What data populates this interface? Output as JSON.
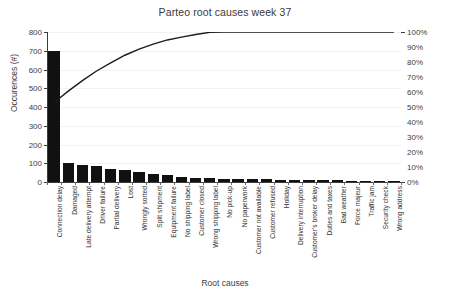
{
  "chart_data": {
    "type": "bar",
    "title": "Parteo root causes week 37",
    "xlabel": "Root causes",
    "ylabel": "Occurences (#)",
    "ylabel_secondary": "",
    "grid": true,
    "legend": "none",
    "ylim": [
      0,
      800
    ],
    "ylim_secondary": [
      0,
      100
    ],
    "ytick_labels": [
      "0",
      "100",
      "200",
      "300",
      "400",
      "500",
      "600",
      "700",
      "800"
    ],
    "ytick_values": [
      0,
      100,
      200,
      300,
      400,
      500,
      600,
      700,
      800
    ],
    "ytick_labels_secondary": [
      "0%",
      "10%",
      "20%",
      "30%",
      "40%",
      "50%",
      "60%",
      "70%",
      "80%",
      "90%",
      "100%"
    ],
    "ytick_values_secondary": [
      0,
      10,
      20,
      30,
      40,
      50,
      60,
      70,
      80,
      90,
      100
    ],
    "categories": [
      "Connection delay",
      "Damaged",
      "Late delivery attempt",
      "Driver failure",
      "Partial delivery",
      "Lost",
      "Wrongly sorted",
      "Split shipment",
      "Equipment failure",
      "No shipping label",
      "Customer closed",
      "Wrong shipping label",
      "No pick-up",
      "No paperwork",
      "Customer not available",
      "Customer refused",
      "Holiday",
      "Delivery interruption",
      "Customer's broker delay",
      "Duties and taxes",
      "Bad weather",
      "Force majeur",
      "Traffic jam",
      "Security check",
      "Wrong address"
    ],
    "values": [
      700,
      100,
      92,
      84,
      72,
      66,
      54,
      44,
      36,
      26,
      22,
      20,
      18,
      16,
      15,
      14,
      13,
      12,
      11,
      10,
      9,
      8,
      7,
      6,
      5
    ],
    "series": [
      {
        "name": "Occurences (#)",
        "type": "bar",
        "axis": "left",
        "values": [
          700,
          100,
          92,
          84,
          72,
          66,
          54,
          44,
          36,
          26,
          22,
          20,
          18,
          16,
          15,
          14,
          13,
          12,
          11,
          10,
          9,
          8,
          7,
          6,
          5
        ]
      },
      {
        "name": "Cumulative %",
        "type": "line",
        "axis": "right",
        "values": [
          53.0,
          60.6,
          67.6,
          74.0,
          79.4,
          84.5,
          88.6,
          91.9,
          94.7,
          96.6,
          98.3,
          99.8,
          101.2,
          102.4,
          103.5,
          104.6,
          105.6,
          106.5,
          107.3,
          108.1,
          108.8,
          109.4,
          109.9,
          110.4,
          110.8
        ]
      }
    ],
    "cumulative_percent": [
      53.0,
      60.6,
      67.6,
      74.0,
      79.4,
      84.5,
      88.6,
      91.9,
      94.7,
      96.6,
      98.3,
      99.8,
      101.2,
      102.4,
      103.5,
      104.6,
      105.6,
      106.5,
      107.3,
      108.1,
      108.8,
      109.4,
      109.9,
      110.4,
      110.8
    ],
    "colors": {
      "bar": "#111111",
      "line": "#1c1c1c",
      "grid": "#f2f2f2",
      "axis": "#3c3c3c",
      "text": "#3a3a3a",
      "background": "#ffffff"
    }
  }
}
